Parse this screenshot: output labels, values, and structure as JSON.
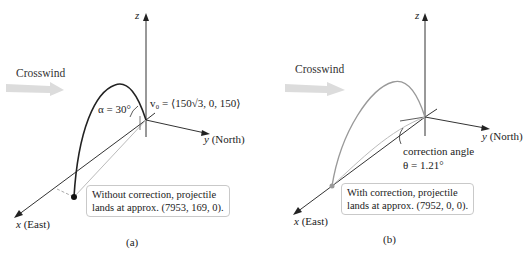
{
  "figure": {
    "panels": [
      {
        "id": "a",
        "caption": "(a)",
        "crosswind_label": "Crosswind",
        "axes": {
          "z": "z",
          "y_var": "y",
          "y_dir": "(North)",
          "x_var": "x",
          "x_dir": "(East)"
        },
        "angle_label": "α = 30°",
        "velocity_label": "v₀ = ⟨150√3, 0, 150⟩",
        "callout_line1": "Without correction, projectile",
        "callout_line2": "lands at approx. (7953, 169, 0).",
        "trajectory_color": "#222222"
      },
      {
        "id": "b",
        "caption": "(b)",
        "crosswind_label": "Crosswind",
        "axes": {
          "z": "z",
          "y_var": "y",
          "y_dir": "(North)",
          "x_var": "x",
          "x_dir": "(East)"
        },
        "correction_label_line1": "correction angle",
        "correction_label_line2": "θ = 1.21°",
        "callout_line1": "With correction, projectile",
        "callout_line2": "lands at approx. (7952, 0, 0).",
        "trajectory_color": "#999999"
      }
    ],
    "colors": {
      "axis": "#333333",
      "wind_arrow": "#d8d8d8",
      "callout_border": "#c9c9c9",
      "ground_path": "#bbbbbb"
    }
  }
}
